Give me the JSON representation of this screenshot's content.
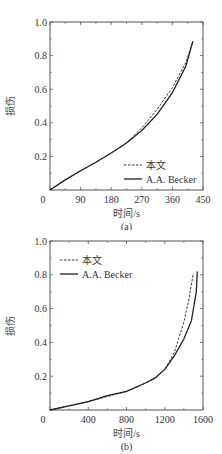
{
  "chart_data": [
    {
      "type": "line",
      "panel": "(a)",
      "xlabel": "时间/s",
      "ylabel": "损伤",
      "xlim": [
        0,
        450
      ],
      "ylim": [
        0,
        1.0
      ],
      "xticks": [
        0,
        90,
        180,
        270,
        360,
        450
      ],
      "yticks": [
        0.2,
        0.4,
        0.6,
        0.8,
        1.0
      ],
      "ytick_labels": [
        "0.2",
        "0.4",
        "0.6",
        "0.8",
        "1.0"
      ],
      "legend_position": "lower right",
      "series": [
        {
          "name": "本文",
          "style": "dashed",
          "x": [
            0,
            45,
            90,
            135,
            180,
            225,
            270,
            315,
            360,
            400,
            420
          ],
          "y": [
            0,
            0.06,
            0.115,
            0.165,
            0.22,
            0.28,
            0.37,
            0.48,
            0.61,
            0.76,
            0.885
          ]
        },
        {
          "name": "A.A. Becker",
          "style": "solid",
          "x": [
            0,
            45,
            90,
            135,
            180,
            225,
            270,
            315,
            360,
            400,
            420
          ],
          "y": [
            0,
            0.06,
            0.115,
            0.165,
            0.22,
            0.28,
            0.355,
            0.45,
            0.58,
            0.74,
            0.885
          ]
        }
      ]
    },
    {
      "type": "line",
      "panel": "(b)",
      "xlabel": "时间/s",
      "ylabel": "损伤",
      "xlim": [
        0,
        1600
      ],
      "ylim": [
        0,
        1.0
      ],
      "xticks": [
        0,
        400,
        800,
        1200,
        1600
      ],
      "yticks": [
        0.2,
        0.4,
        0.6,
        0.8,
        1.0
      ],
      "ytick_labels": [
        "0.2",
        "0.4",
        "0.6",
        "0.8",
        "1.0"
      ],
      "legend_position": "upper left",
      "series": [
        {
          "name": "本文",
          "style": "dashed",
          "x": [
            0,
            200,
            400,
            600,
            800,
            1000,
            1100,
            1200,
            1300,
            1400,
            1450,
            1500
          ],
          "y": [
            0,
            0.025,
            0.05,
            0.08,
            0.11,
            0.16,
            0.19,
            0.24,
            0.34,
            0.52,
            0.65,
            0.81
          ]
        },
        {
          "name": "A.A. Becker",
          "style": "solid",
          "x": [
            0,
            200,
            400,
            600,
            800,
            1000,
            1100,
            1200,
            1300,
            1400,
            1480,
            1530,
            1540
          ],
          "y": [
            0,
            0.025,
            0.05,
            0.085,
            0.11,
            0.16,
            0.19,
            0.24,
            0.32,
            0.42,
            0.53,
            0.7,
            0.82
          ]
        }
      ]
    }
  ]
}
